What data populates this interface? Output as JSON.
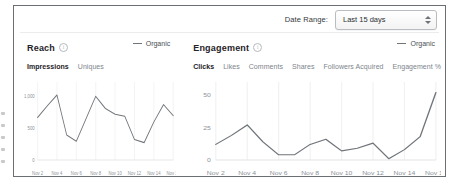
{
  "header": {
    "date_range_label": "Date Range:",
    "date_range_value": "Last 15 days",
    "stepper_icon": "updown-stepper-icon"
  },
  "panels": [
    {
      "title": "Reach",
      "info_icon": "info-icon",
      "legend": {
        "label": "Organic",
        "marker": "line-dash-marker",
        "color": "#6f7478"
      },
      "tabs": [
        {
          "label": "Impressions",
          "active": true
        },
        {
          "label": "Uniques",
          "active": false
        }
      ]
    },
    {
      "title": "Engagement",
      "info_icon": "info-icon",
      "legend": {
        "label": "Organic",
        "marker": "line-dash-marker",
        "color": "#6f7478"
      },
      "tabs": [
        {
          "label": "Clicks",
          "active": true
        },
        {
          "label": "Likes",
          "active": false
        },
        {
          "label": "Comments",
          "active": false
        },
        {
          "label": "Shares",
          "active": false
        },
        {
          "label": "Followers Acquired",
          "active": false
        },
        {
          "label": "Engagement %",
          "active": false
        }
      ]
    }
  ],
  "chart_data": [
    {
      "type": "line",
      "title": "Reach",
      "series_name": "Organic",
      "xlabel": "",
      "ylabel": "Impressions",
      "x": [
        "Nov 2",
        "Nov 3",
        "Nov 4",
        "Nov 5",
        "Nov 6",
        "Nov 7",
        "Nov 8",
        "Nov 9",
        "Nov 10",
        "Nov 11",
        "Nov 12",
        "Nov 13",
        "Nov 14",
        "Nov 15",
        "Nov 16"
      ],
      "values": [
        660,
        840,
        1010,
        390,
        290,
        640,
        990,
        800,
        710,
        680,
        320,
        270,
        590,
        860,
        690
      ],
      "ytick_labels": [
        "0",
        "500",
        "1,000"
      ],
      "ytick_values": [
        0,
        500,
        1000
      ],
      "ylim": [
        0,
        1150
      ],
      "xtick_labels": [
        "Nov 2",
        "Nov 4",
        "Nov 6",
        "Nov 8",
        "Nov 10",
        "Nov 12",
        "Nov 14",
        "Nov 16"
      ],
      "grid": "vertical",
      "legend_position": "top-right",
      "line_color": "#70757a"
    },
    {
      "type": "line",
      "title": "Engagement",
      "series_name": "Organic",
      "xlabel": "",
      "ylabel": "Clicks",
      "x": [
        "Nov 2",
        "Nov 3",
        "Nov 4",
        "Nov 5",
        "Nov 6",
        "Nov 7",
        "Nov 8",
        "Nov 9",
        "Nov 10",
        "Nov 11",
        "Nov 12",
        "Nov 13",
        "Nov 14",
        "Nov 15",
        "Nov 16"
      ],
      "values": [
        12,
        19,
        27,
        14,
        4,
        4,
        12,
        16,
        7,
        9,
        13,
        1,
        8,
        18,
        52
      ],
      "ytick_labels": [
        "0",
        "25",
        "50"
      ],
      "ytick_values": [
        0,
        25,
        50
      ],
      "ylim": [
        0,
        57
      ],
      "xtick_labels": [
        "Nov 2",
        "Nov 4",
        "Nov 6",
        "Nov 8",
        "Nov 10",
        "Nov 12",
        "Nov 14",
        "Nov 16"
      ],
      "grid": "vertical",
      "legend_position": "top-right",
      "line_color": "#70757a"
    }
  ]
}
